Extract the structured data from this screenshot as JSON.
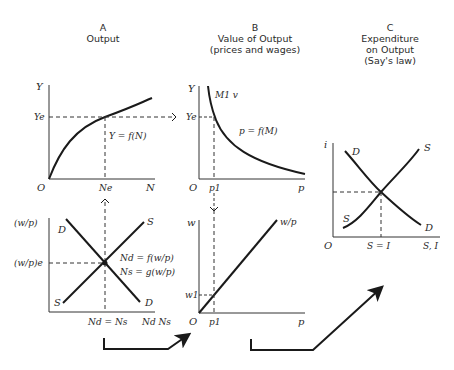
{
  "panels": {
    "a": {
      "letter": "A",
      "title": "Output",
      "top": {
        "y_label": "Y",
        "ye_label": "Ye",
        "origin_label": "O",
        "ne_label": "Ne",
        "x_label": "N",
        "curve_label": "Y = f(N)"
      },
      "bottom": {
        "y_label": "(w/p)",
        "ye_label": "(w/p)e",
        "d_top": "D",
        "s_top": "S",
        "s_bottom": "S",
        "d_bottom": "D",
        "eq1": "Nd = f(w/p)",
        "eq2": "Ns = g(w/p)",
        "x_mid_label": "Nd = Ns",
        "x_label": "Nd Ns"
      }
    },
    "b": {
      "letter": "B",
      "title_line1": "Value of Output",
      "title_line2": "(prices and wages)",
      "top": {
        "y_label": "Y",
        "ye_label": "Ye",
        "curve_top_label": "M1 v",
        "curve_label": "p = f(M)",
        "origin_label": "O",
        "p1_label": "p1",
        "x_label": "p"
      },
      "bottom": {
        "y_label": "w",
        "w1_label": "w1",
        "line_label": "w/p",
        "origin_label": "O",
        "p1_label": "p1",
        "x_label": "p"
      }
    },
    "c": {
      "letter": "C",
      "title_line1": "Expenditure",
      "title_line2": "on Output",
      "title_line3": "(Say's law)",
      "y_label": "i",
      "d_top": "D",
      "s_top": "S",
      "s_bottom": "S",
      "d_bottom": "D",
      "origin_label": "O",
      "x_mid_label": "S = I",
      "x_label": "S, I"
    }
  },
  "colors": {
    "ink": "#1a1a1a",
    "axis": "#333333",
    "background": "#ffffff"
  }
}
